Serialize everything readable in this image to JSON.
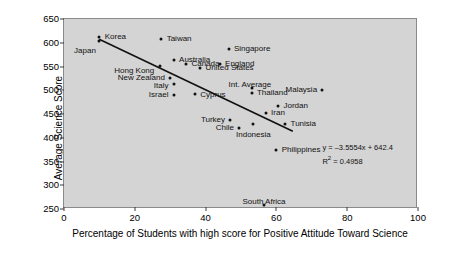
{
  "chart_data": {
    "type": "scatter",
    "title": "",
    "xlabel": "Percentage of Students with high score for Positive Attitude Toward Science",
    "ylabel": "Average Science Score",
    "xlim": [
      0,
      100
    ],
    "ylim": [
      250,
      650
    ],
    "xticks": [
      0,
      20,
      40,
      60,
      80,
      100
    ],
    "yticks": [
      250,
      300,
      350,
      400,
      450,
      500,
      550,
      600,
      650
    ],
    "grid": false,
    "legend": null,
    "plot_background": "#d4d4d4",
    "marker_color": "#111111",
    "trendline": {
      "equation": "y = –3.5554x + 642.4",
      "r_squared_label": "R",
      "r_squared_sup": "2",
      "r_squared_value": "= 0.4958",
      "slope": -3.5554,
      "intercept": 642.4,
      "r2": 0.4958,
      "x_start": 10,
      "x_end": 65
    },
    "points": [
      {
        "label": "Korea",
        "x": 10,
        "y": 613,
        "lx": 11.5,
        "ly": 613,
        "anchor": "r"
      },
      {
        "label": "Japan",
        "x": 10,
        "y": 603,
        "lx": 9.0,
        "ly": 583,
        "anchor": "l"
      },
      {
        "label": "Taiwan",
        "x": 27.5,
        "y": 608,
        "lx": 29,
        "ly": 608,
        "anchor": "r"
      },
      {
        "label": "Singapore",
        "x": 46.5,
        "y": 587,
        "lx": 48,
        "ly": 587,
        "anchor": "r"
      },
      {
        "label": "Australia",
        "x": 31,
        "y": 563,
        "lx": 32.5,
        "ly": 563,
        "anchor": "r"
      },
      {
        "label": "Canada",
        "x": 34.5,
        "y": 555,
        "lx": 36,
        "ly": 555,
        "anchor": "r"
      },
      {
        "label": "England",
        "x": 44,
        "y": 555,
        "lx": 45.5,
        "ly": 555,
        "anchor": "r"
      },
      {
        "label": "United States",
        "x": 38.5,
        "y": 546,
        "lx": 40,
        "ly": 546,
        "anchor": "r"
      },
      {
        "label": "Hong Kong",
        "x": 27,
        "y": 551,
        "lx": 25.5,
        "ly": 540,
        "anchor": "l"
      },
      {
        "label": "New Zealand",
        "x": 30,
        "y": 525,
        "lx": 28.5,
        "ly": 525,
        "anchor": "l"
      },
      {
        "label": "Italy",
        "x": 31,
        "y": 514,
        "lx": 29.5,
        "ly": 510,
        "anchor": "l"
      },
      {
        "label": "Israel",
        "x": 31,
        "y": 489,
        "lx": 29.5,
        "ly": 489,
        "anchor": "l"
      },
      {
        "label": "Cyprus",
        "x": 37,
        "y": 493,
        "lx": 38.5,
        "ly": 489,
        "anchor": "r"
      },
      {
        "label": "Int. Average",
        "x": 53,
        "y": 505,
        "lx": 46.5,
        "ly": 512,
        "anchor": "r"
      },
      {
        "label": "Thailand",
        "x": 53,
        "y": 495,
        "lx": 54.5,
        "ly": 495,
        "anchor": "r"
      },
      {
        "label": "Malaysia",
        "x": 73,
        "y": 501,
        "lx": 71.5,
        "ly": 501,
        "anchor": "l"
      },
      {
        "label": "Jordan",
        "x": 60.5,
        "y": 466,
        "lx": 62,
        "ly": 466,
        "anchor": "r"
      },
      {
        "label": "Iran",
        "x": 57,
        "y": 452,
        "lx": 58.5,
        "ly": 452,
        "anchor": "r"
      },
      {
        "label": "Turkey",
        "x": 47,
        "y": 437,
        "lx": 45.5,
        "ly": 437,
        "anchor": "l"
      },
      {
        "label": "Chile",
        "x": 49.5,
        "y": 420,
        "lx": 48,
        "ly": 420,
        "anchor": "l"
      },
      {
        "label": "Indonesia",
        "x": 53.5,
        "y": 428,
        "lx": 53.5,
        "ly": 415,
        "anchor": "c"
      },
      {
        "label": "Tunisia",
        "x": 62.5,
        "y": 428,
        "lx": 64,
        "ly": 428,
        "anchor": "r"
      },
      {
        "label": "Philippines",
        "x": 60,
        "y": 375,
        "lx": 61.5,
        "ly": 375,
        "anchor": "r"
      },
      {
        "label": "South Africa",
        "x": 56.5,
        "y": 258,
        "lx": 56.5,
        "ly": 274,
        "anchor": "c"
      }
    ],
    "equation_pos": {
      "x": 73,
      "y": 388
    }
  }
}
